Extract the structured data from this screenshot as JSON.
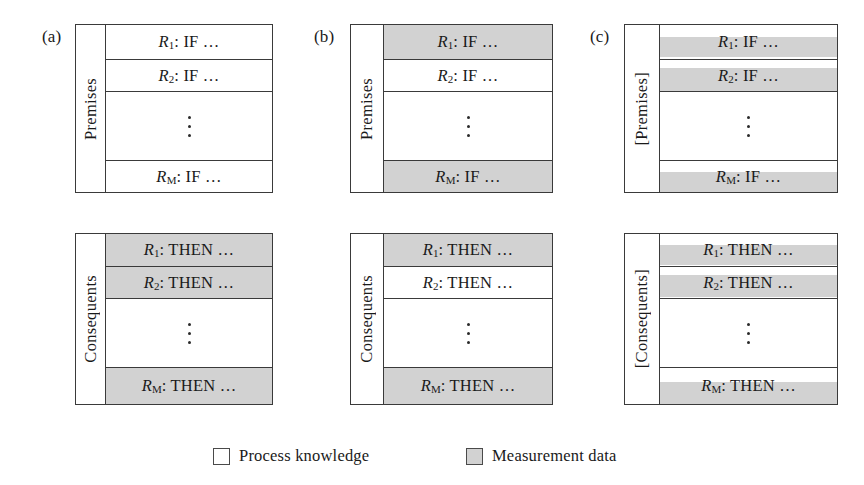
{
  "figure": {
    "legend": {
      "items": [
        {
          "swatch": "white",
          "label": "Process knowledge"
        },
        {
          "swatch": "gray",
          "label": "Measurement data"
        }
      ]
    },
    "panels": [
      {
        "key": "a",
        "label": "(a)",
        "blocks": [
          {
            "key": "premises",
            "side_label": "Premises",
            "rows": [
              {
                "id": "r1",
                "prefix": "R",
                "sub": "1",
                "text": ": IF …",
                "shading": "none"
              },
              {
                "id": "r2",
                "prefix": "R",
                "sub": "2",
                "text": ": IF …",
                "shading": "none"
              },
              {
                "id": "dots",
                "prefix": "",
                "sub": "",
                "text": "",
                "shading": "none"
              },
              {
                "id": "rM",
                "prefix": "R",
                "sub": "M",
                "text": ": IF …",
                "shading": "none"
              }
            ]
          },
          {
            "key": "consequents",
            "side_label": "Consequents",
            "rows": [
              {
                "id": "r1",
                "prefix": "R",
                "sub": "1",
                "text": ": THEN …",
                "shading": "full"
              },
              {
                "id": "r2",
                "prefix": "R",
                "sub": "2",
                "text": ": THEN …",
                "shading": "full"
              },
              {
                "id": "dots",
                "prefix": "",
                "sub": "",
                "text": "",
                "shading": "none"
              },
              {
                "id": "rM",
                "prefix": "R",
                "sub": "M",
                "text": ": THEN …",
                "shading": "full"
              }
            ]
          }
        ]
      },
      {
        "key": "b",
        "label": "(b)",
        "blocks": [
          {
            "key": "premises",
            "side_label": "Premises",
            "rows": [
              {
                "id": "r1",
                "prefix": "R",
                "sub": "1",
                "text": ": IF …",
                "shading": "full"
              },
              {
                "id": "r2",
                "prefix": "R",
                "sub": "2",
                "text": ": IF …",
                "shading": "none"
              },
              {
                "id": "dots",
                "prefix": "",
                "sub": "",
                "text": "",
                "shading": "none"
              },
              {
                "id": "rM",
                "prefix": "R",
                "sub": "M",
                "text": ": IF …",
                "shading": "full"
              }
            ]
          },
          {
            "key": "consequents",
            "side_label": "Consequents",
            "rows": [
              {
                "id": "r1",
                "prefix": "R",
                "sub": "1",
                "text": ": THEN …",
                "shading": "full"
              },
              {
                "id": "r2",
                "prefix": "R",
                "sub": "2",
                "text": ": THEN …",
                "shading": "none"
              },
              {
                "id": "dots",
                "prefix": "",
                "sub": "",
                "text": "",
                "shading": "none"
              },
              {
                "id": "rM",
                "prefix": "R",
                "sub": "M",
                "text": ": THEN …",
                "shading": "full"
              }
            ]
          }
        ]
      },
      {
        "key": "c",
        "label": "(c)",
        "blocks": [
          {
            "key": "premises",
            "side_label": "[Premises]",
            "rows": [
              {
                "id": "r1",
                "prefix": "R",
                "sub": "1",
                "text": ": IF …",
                "shading": "band"
              },
              {
                "id": "r2",
                "prefix": "R",
                "sub": "2",
                "text": ": IF …",
                "shading": "band"
              },
              {
                "id": "dots",
                "prefix": "",
                "sub": "",
                "text": "",
                "shading": "none"
              },
              {
                "id": "rM",
                "prefix": "R",
                "sub": "M",
                "text": ": IF …",
                "shading": "band"
              }
            ]
          },
          {
            "key": "consequents",
            "side_label": "[Consequents]",
            "rows": [
              {
                "id": "r1",
                "prefix": "R",
                "sub": "1",
                "text": ": THEN …",
                "shading": "band"
              },
              {
                "id": "r2",
                "prefix": "R",
                "sub": "2",
                "text": ": THEN …",
                "shading": "band"
              },
              {
                "id": "dots",
                "prefix": "",
                "sub": "",
                "text": "",
                "shading": "none"
              },
              {
                "id": "rM",
                "prefix": "R",
                "sub": "M",
                "text": ": THEN …",
                "shading": "band"
              }
            ]
          }
        ]
      }
    ],
    "colors": {
      "shade": "#d2d2d2",
      "line": "#3a3a3a",
      "background": "#ffffff"
    }
  }
}
